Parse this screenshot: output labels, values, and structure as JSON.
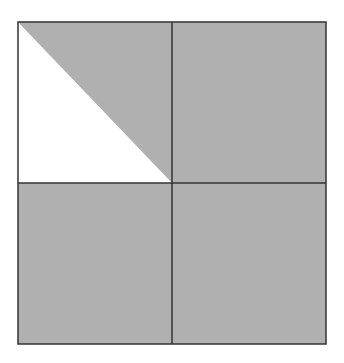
{
  "diagram": {
    "grid": {
      "rows": 2,
      "cols": 2
    },
    "shaded_fraction": 0.875,
    "colors": {
      "shade": "#b0b0b0",
      "unshaded": "#ffffff",
      "line": "#333333"
    },
    "cells": [
      {
        "row": 0,
        "col": 0,
        "shading": "upper-right-triangle"
      },
      {
        "row": 0,
        "col": 1,
        "shading": "full"
      },
      {
        "row": 1,
        "col": 0,
        "shading": "full"
      },
      {
        "row": 1,
        "col": 1,
        "shading": "full"
      }
    ]
  }
}
